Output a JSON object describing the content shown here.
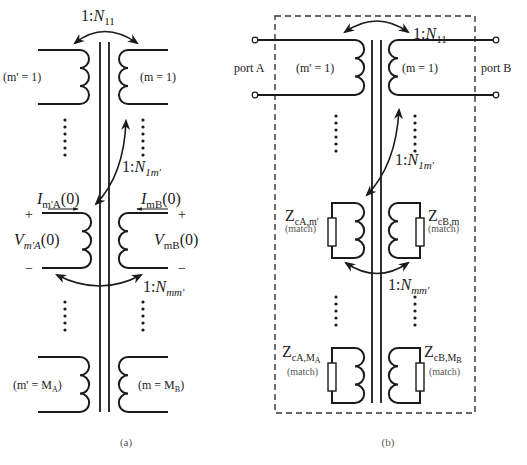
{
  "figure": {
    "panel_a": {
      "caption": "(a)",
      "ratio_top": {
        "prefix": "1:",
        "var": "N",
        "sub": "11"
      },
      "ratio_mid": {
        "prefix": "1:",
        "var": "N",
        "sub": "1m'"
      },
      "ratio_mm": {
        "prefix": "1:",
        "var": "N",
        "sub": "mm'"
      },
      "coil_top_left_label": "(m' = 1)",
      "coil_top_right_label": "(m = 1)",
      "coil_bottom_left_label": "(m' = M",
      "coil_bottom_left_sub": "A",
      "coil_bottom_right_label": "(m = M",
      "coil_bottom_right_sub": "B",
      "close_paren": ")",
      "current_left": {
        "var": "I",
        "sub": "m'A",
        "arg": "(0)"
      },
      "current_right": {
        "var": "I",
        "sub": "mB",
        "arg": "(0)"
      },
      "voltage_left": {
        "var": "V",
        "sub": "m'A",
        "arg": "(0)"
      },
      "voltage_right": {
        "var": "V",
        "sub": "mB",
        "arg": "(0)"
      },
      "plus": "+",
      "minus": "−"
    },
    "panel_b": {
      "caption": "(b)",
      "port_a": "port A",
      "port_b": "port B",
      "ratio_top": {
        "prefix": "1:",
        "var": "N",
        "sub": "11"
      },
      "ratio_mid": {
        "prefix": "1:",
        "var": "N",
        "sub": "1m'"
      },
      "ratio_mm": {
        "prefix": "1:",
        "var": "N",
        "sub": "mm'"
      },
      "coil_top_left_label": "(m' = 1)",
      "coil_top_right_label": "(m = 1)",
      "z_mid_left": {
        "var": "Z",
        "sub": "cA,m'"
      },
      "z_mid_right": {
        "var": "Z",
        "sub": "cB,m"
      },
      "z_bot_left": {
        "var": "Z",
        "sub": "cA,M",
        "sub2": "A"
      },
      "z_bot_right": {
        "var": "Z",
        "sub": "cB,M",
        "sub2": "B"
      },
      "match": "(match)"
    },
    "colors": {
      "line": "#1a1a1a",
      "dashed_box": "#333333",
      "background": "#ffffff"
    }
  }
}
